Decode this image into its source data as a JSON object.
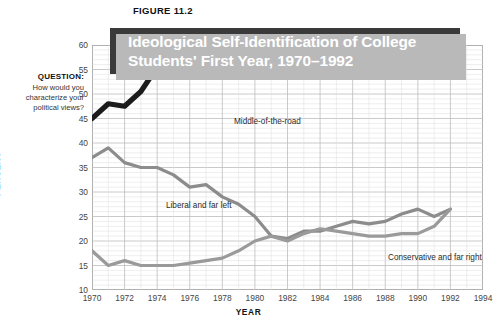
{
  "figure_label": "FIGURE 11.2",
  "title": "Ideological Self-Identification of College\nStudents' First Year, 1970–1992",
  "question": {
    "heading": "QUESTION:",
    "text": "How would you characterize your political views?"
  },
  "colors": {
    "banner": "#3a3a3a",
    "banner_shadow": "#b9b9b9",
    "middle_of_the_road": "#1c1c1c",
    "liberal": "#8c8c8c",
    "conservative": "#9a9a9a",
    "grid_major": "#bdbdbd",
    "grid_minor": "#dcdcdc",
    "frame": "#a8a8a8"
  },
  "chart_data": {
    "type": "line",
    "title": "Ideological Self-Identification of College Students' First Year, 1970–1992",
    "xlabel": "YEAR",
    "ylabel": "PERCENT",
    "xlim": [
      1970,
      1994
    ],
    "ylim": [
      10,
      60
    ],
    "ytick_labels": [
      "10",
      "15",
      "20",
      "25",
      "30",
      "35",
      "40",
      "45",
      "50",
      "55",
      "60"
    ],
    "yticks": [
      10,
      15,
      20,
      25,
      30,
      35,
      40,
      45,
      50,
      55,
      60
    ],
    "xtick_labels": [
      "1970",
      "1972",
      "1974",
      "1976",
      "1978",
      "1980",
      "1982",
      "1984",
      "1986",
      "1988",
      "1990",
      "1992",
      "1994"
    ],
    "xticks": [
      1970,
      1972,
      1974,
      1976,
      1978,
      1980,
      1982,
      1984,
      1986,
      1988,
      1990,
      1992,
      1994
    ],
    "grid": true,
    "legend": "inline-annotations",
    "x": [
      1970,
      1971,
      1972,
      1973,
      1974,
      1975,
      1976,
      1977,
      1978,
      1979,
      1980,
      1981,
      1982,
      1983,
      1984,
      1985,
      1986,
      1987,
      1988,
      1989,
      1990,
      1991,
      1992
    ],
    "series": [
      {
        "name": "Middle-of-the-road",
        "color": "#1c1c1c",
        "values": [
          45.0,
          48.0,
          47.5,
          50.5,
          55.5,
          54.0,
          55.5,
          56.5,
          57.5,
          58.5,
          60.0,
          60.0,
          60.0,
          60.0,
          58.0,
          57.0,
          56.0,
          55.0,
          55.0,
          55.5,
          55.0,
          54.0,
          53.5
        ]
      },
      {
        "name": "Liberal and far left",
        "color": "#8c8c8c",
        "values": [
          37.0,
          39.0,
          36.0,
          35.0,
          35.0,
          33.5,
          31.0,
          31.5,
          29.0,
          27.5,
          25.0,
          21.0,
          20.5,
          22.0,
          22.0,
          23.0,
          24.0,
          23.5,
          24.0,
          25.5,
          26.5,
          25.0,
          26.5
        ]
      },
      {
        "name": "Conservative and far right",
        "color": "#9a9a9a",
        "values": [
          18.0,
          15.0,
          16.0,
          15.0,
          15.0,
          15.0,
          15.5,
          16.0,
          16.5,
          18.0,
          20.0,
          21.0,
          20.0,
          21.5,
          22.5,
          22.0,
          21.5,
          21.0,
          21.0,
          21.5,
          21.5,
          23.0,
          26.5
        ]
      }
    ],
    "annotations": [
      {
        "text": "Middle-of-the-road",
        "series": "Middle-of-the-road"
      },
      {
        "text": "Liberal and far left",
        "series": "Liberal and far left"
      },
      {
        "text": "Conservative and far right",
        "series": "Conservative and far right"
      }
    ]
  }
}
